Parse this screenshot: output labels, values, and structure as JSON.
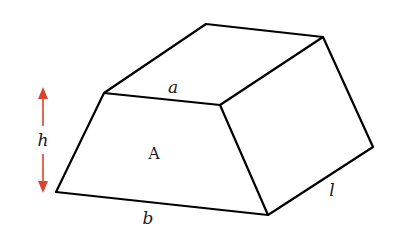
{
  "diagram": {
    "type": "trapezoidal-prism",
    "labels": {
      "top_edge": "a",
      "bottom_edge": "b",
      "face": "A",
      "height": "h",
      "length": "l"
    },
    "colors": {
      "stroke": "#000000",
      "height_arrow": "#d9432f",
      "background": "#ffffff"
    }
  }
}
